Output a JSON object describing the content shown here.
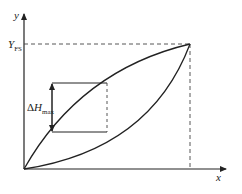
{
  "diagram": {
    "type": "hysteresis-curve",
    "axes": {
      "x_label": "x",
      "y_label": "y"
    },
    "labels": {
      "full_scale": {
        "main": "Y",
        "sub": "FS"
      },
      "max_hysteresis": {
        "delta": "Δ",
        "main": "H",
        "sub": "max"
      }
    },
    "colors": {
      "line": "#222222",
      "dashed": "#444444"
    }
  }
}
